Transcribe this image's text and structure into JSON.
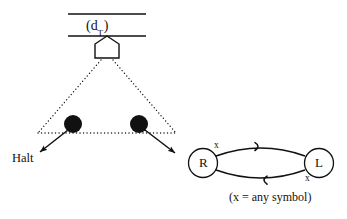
{
  "figure": {
    "type": "turing-machine-diagram",
    "background_color": "#ffffff",
    "ink_color": "#111111"
  },
  "tape": {
    "label": "(d",
    "label_subscript": "T",
    "label_close": ")",
    "full_label": "(dT)",
    "top_line": {
      "x1": 68,
      "y1": 14,
      "x2": 146,
      "y2": 14
    },
    "bottom_line": {
      "x1": 68,
      "y1": 36,
      "x2": 146,
      "y2": 36
    }
  },
  "head": {
    "name": "read-write-head",
    "shape": "pentagon-up",
    "x": 95,
    "y": 36,
    "width": 24,
    "height": 22
  },
  "fan": {
    "style": "dotted",
    "apex": {
      "x": 107,
      "y": 60
    },
    "left_base": {
      "x": 38,
      "y": 133
    },
    "right_base": {
      "x": 176,
      "y": 133
    }
  },
  "nodes": [
    {
      "name": "computation-node-left",
      "cx": 73,
      "cy": 124,
      "r": 9,
      "fill": "#111111"
    },
    {
      "name": "computation-node-right",
      "cx": 139,
      "cy": 124,
      "r": 9,
      "fill": "#111111"
    }
  ],
  "arrows": [
    {
      "name": "arrow-to-halt",
      "from": {
        "x": 68,
        "y": 130
      },
      "to": {
        "x": 40,
        "y": 152
      }
    },
    {
      "name": "arrow-to-machine",
      "from": {
        "x": 145,
        "y": 130
      },
      "to": {
        "x": 175,
        "y": 152
      }
    }
  ],
  "halt": {
    "label": "Halt",
    "x": 12,
    "y": 152
  },
  "automaton": {
    "states": [
      {
        "id": "R",
        "label": "R",
        "cx": 203,
        "cy": 163,
        "rx": 15,
        "ry": 14
      },
      {
        "id": "L",
        "label": "L",
        "cx": 319,
        "cy": 163,
        "rx": 15,
        "ry": 14
      }
    ],
    "transitions": [
      {
        "name": "transition-r-to-l",
        "from": "R",
        "to": "L",
        "label": "x",
        "direction": "right",
        "label_x": 214,
        "label_y": 142
      },
      {
        "name": "transition-l-to-r",
        "from": "L",
        "to": "R",
        "label": "x",
        "direction": "left",
        "label_x": 306,
        "label_y": 177
      }
    ],
    "caption": "(x = any symbol)",
    "caption_x": 233,
    "caption_y": 197
  }
}
